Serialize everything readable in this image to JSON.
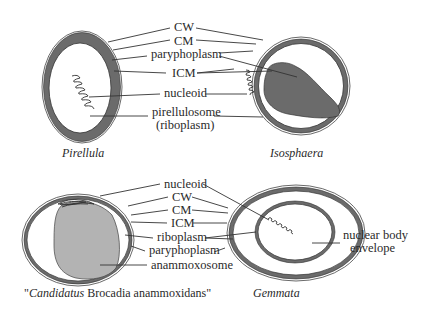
{
  "figure": {
    "colors": {
      "background": "#ffffff",
      "dark_fill": "#6b6b6b",
      "light_fill": "#b3b3b3",
      "line": "#333333",
      "text": "#2a2a2a"
    },
    "panels": [
      {
        "id": "pirellula",
        "caption": "Pirellula",
        "caption_italic": true
      },
      {
        "id": "isosphaera",
        "caption": "Isosphaera",
        "caption_italic": true
      },
      {
        "id": "brocadia",
        "caption_quote_open": "\"",
        "caption_italic_part": "Candidatus",
        "caption_plain_part": " Brocadia anammoxidans",
        "caption_quote_close": "\""
      },
      {
        "id": "gemmata",
        "caption": "Gemmata",
        "caption_italic": true,
        "side_label_line1": "nuclear body",
        "side_label_line2": "envelope"
      }
    ],
    "top_labels": {
      "cw": "CW",
      "cm": "CM",
      "paryphoplasm": "paryphoplasm",
      "icm": "ICM",
      "nucleoid": "nucleoid",
      "pirellulosome_line1": "pirellulosome",
      "pirellulosome_line2": "(riboplasm)"
    },
    "bottom_labels": {
      "nucleoid": "nucleoid",
      "cw": "CW",
      "cm": "CM",
      "icm": "ICM",
      "riboplasm": "riboplasm",
      "paryphoplasm": "paryphoplasm",
      "anammoxosome": "anammoxosome"
    }
  }
}
